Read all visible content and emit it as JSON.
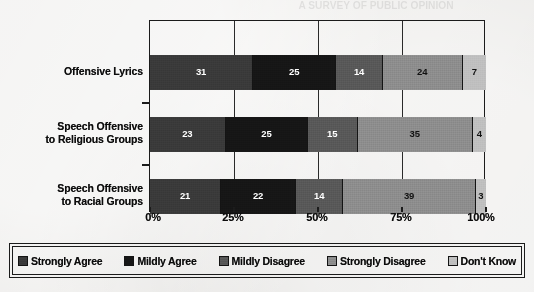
{
  "background": "#efeeec",
  "bleed_text": "A SURVEY OF PUBLIC OPINION",
  "chart_data": {
    "type": "bar",
    "orientation": "horizontal",
    "stacked": true,
    "stack_mode": "percent",
    "title": "",
    "subtitle": "",
    "xlabel": "",
    "ylabel": "",
    "xlim": [
      0,
      100
    ],
    "grid": true,
    "legend_position": "bottom",
    "categories": [
      "Offensive Lyrics",
      "Speech Offensive to Religious Groups",
      "Speech Offensive to Racial Groups"
    ],
    "category_lines": [
      [
        "Offensive Lyrics"
      ],
      [
        "Speech Offensive",
        "to Religious Groups"
      ],
      [
        "Speech Offensive",
        "to Racial Groups"
      ]
    ],
    "tick_labels": [
      "0%",
      "25%",
      "50%",
      "75%",
      "100%"
    ],
    "tick_values": [
      0,
      25,
      50,
      75,
      100
    ],
    "series": [
      {
        "name": "Strongly Agree",
        "color": "#3a3a3a",
        "text_color": "#ffffff",
        "values": [
          31,
          23,
          21
        ]
      },
      {
        "name": "Mildly Agree",
        "color": "#161616",
        "text_color": "#ffffff",
        "values": [
          25,
          25,
          22
        ]
      },
      {
        "name": "Mildly Disagree",
        "color": "#585858",
        "text_color": "#ffffff",
        "values": [
          14,
          15,
          14
        ]
      },
      {
        "name": "Strongly Disagree",
        "color": "#8d8d8d",
        "text_color": "#111111",
        "values": [
          24,
          35,
          39
        ]
      },
      {
        "name": "Don't Know",
        "color": "#bfbfbf",
        "text_color": "#111111",
        "values": [
          7,
          4,
          3
        ]
      }
    ],
    "row_totals": [
      101,
      102,
      99
    ]
  },
  "legend": {
    "items": [
      {
        "label": "Strongly Agree",
        "color": "#3a3a3a"
      },
      {
        "label": "Mildly Agree",
        "color": "#161616"
      },
      {
        "label": "Mildly Disagree",
        "color": "#585858"
      },
      {
        "label": "Strongly Disagree",
        "color": "#8d8d8d"
      },
      {
        "label": "Don't Know",
        "color": "#bfbfbf"
      }
    ]
  }
}
